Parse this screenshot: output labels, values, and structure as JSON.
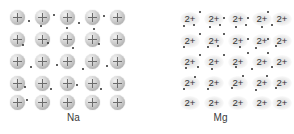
{
  "figure": {
    "background_color": "#ffffff"
  },
  "panels": [
    {
      "id": "na",
      "caption": "Na",
      "element_name": "sodium",
      "ion_symbol": "+",
      "ion_charge": 1,
      "ion_style": "sphere-with-plus",
      "ion_color": "#c9c9c9",
      "electron_color": "#2b2b2b",
      "grid": {
        "rows": 5,
        "cols": 5
      },
      "ion_positions": [
        {
          "x": 10,
          "y": 10
        },
        {
          "x": 35,
          "y": 10
        },
        {
          "x": 60,
          "y": 10
        },
        {
          "x": 85,
          "y": 10
        },
        {
          "x": 110,
          "y": 10
        },
        {
          "x": 10,
          "y": 32
        },
        {
          "x": 35,
          "y": 32
        },
        {
          "x": 60,
          "y": 32
        },
        {
          "x": 85,
          "y": 32
        },
        {
          "x": 110,
          "y": 32
        },
        {
          "x": 10,
          "y": 54
        },
        {
          "x": 35,
          "y": 54
        },
        {
          "x": 60,
          "y": 54
        },
        {
          "x": 85,
          "y": 54
        },
        {
          "x": 110,
          "y": 54
        },
        {
          "x": 10,
          "y": 76
        },
        {
          "x": 35,
          "y": 76
        },
        {
          "x": 60,
          "y": 76
        },
        {
          "x": 85,
          "y": 76
        },
        {
          "x": 110,
          "y": 76
        },
        {
          "x": 10,
          "y": 95
        },
        {
          "x": 35,
          "y": 95
        },
        {
          "x": 60,
          "y": 95
        },
        {
          "x": 85,
          "y": 95
        },
        {
          "x": 110,
          "y": 95
        }
      ],
      "electron_count": 20,
      "electron_positions": [
        {
          "x": 28,
          "y": 20
        },
        {
          "x": 53,
          "y": 14
        },
        {
          "x": 78,
          "y": 22
        },
        {
          "x": 103,
          "y": 15
        },
        {
          "x": 40,
          "y": 25
        },
        {
          "x": 66,
          "y": 27
        },
        {
          "x": 93,
          "y": 28
        },
        {
          "x": 22,
          "y": 44
        },
        {
          "x": 47,
          "y": 42
        },
        {
          "x": 72,
          "y": 47
        },
        {
          "x": 98,
          "y": 43
        },
        {
          "x": 30,
          "y": 66
        },
        {
          "x": 56,
          "y": 64
        },
        {
          "x": 82,
          "y": 68
        },
        {
          "x": 106,
          "y": 65
        },
        {
          "x": 24,
          "y": 86
        },
        {
          "x": 50,
          "y": 88
        },
        {
          "x": 76,
          "y": 84
        },
        {
          "x": 100,
          "y": 88
        },
        {
          "x": 26,
          "y": 99
        }
      ]
    },
    {
      "id": "mg",
      "caption": "Mg",
      "element_name": "magnesium",
      "ion_symbol": "2+",
      "ion_charge": 2,
      "ion_style": "text-label",
      "ion_color": "#cdcdcd",
      "electron_color": "#2b2b2b",
      "grid": {
        "rows": 5,
        "cols": 5
      },
      "ion_positions": [
        {
          "x": 33,
          "y": 12
        },
        {
          "x": 57,
          "y": 12
        },
        {
          "x": 81,
          "y": 12
        },
        {
          "x": 105,
          "y": 12
        },
        {
          "x": 125,
          "y": 12
        },
        {
          "x": 33,
          "y": 34
        },
        {
          "x": 57,
          "y": 34
        },
        {
          "x": 81,
          "y": 34
        },
        {
          "x": 105,
          "y": 34
        },
        {
          "x": 125,
          "y": 34
        },
        {
          "x": 33,
          "y": 55
        },
        {
          "x": 57,
          "y": 55
        },
        {
          "x": 81,
          "y": 55
        },
        {
          "x": 105,
          "y": 55
        },
        {
          "x": 125,
          "y": 55
        },
        {
          "x": 33,
          "y": 76
        },
        {
          "x": 57,
          "y": 76
        },
        {
          "x": 81,
          "y": 76
        },
        {
          "x": 105,
          "y": 76
        },
        {
          "x": 125,
          "y": 76
        },
        {
          "x": 33,
          "y": 96
        },
        {
          "x": 57,
          "y": 96
        },
        {
          "x": 81,
          "y": 96
        },
        {
          "x": 105,
          "y": 96
        },
        {
          "x": 125,
          "y": 96
        }
      ],
      "electron_count": 40,
      "electron_positions": [
        {
          "x": 52,
          "y": 11
        },
        {
          "x": 76,
          "y": 17
        },
        {
          "x": 100,
          "y": 17
        },
        {
          "x": 120,
          "y": 11
        },
        {
          "x": 36,
          "y": 25
        },
        {
          "x": 46,
          "y": 24
        },
        {
          "x": 62,
          "y": 26
        },
        {
          "x": 72,
          "y": 24
        },
        {
          "x": 88,
          "y": 26
        },
        {
          "x": 98,
          "y": 24
        },
        {
          "x": 114,
          "y": 26
        },
        {
          "x": 124,
          "y": 24
        },
        {
          "x": 52,
          "y": 33
        },
        {
          "x": 76,
          "y": 33
        },
        {
          "x": 100,
          "y": 38
        },
        {
          "x": 120,
          "y": 38
        },
        {
          "x": 36,
          "y": 46
        },
        {
          "x": 60,
          "y": 46
        },
        {
          "x": 70,
          "y": 45
        },
        {
          "x": 92,
          "y": 46
        },
        {
          "x": 108,
          "y": 47
        },
        {
          "x": 128,
          "y": 45
        },
        {
          "x": 52,
          "y": 54
        },
        {
          "x": 76,
          "y": 54
        },
        {
          "x": 100,
          "y": 52
        },
        {
          "x": 120,
          "y": 52
        },
        {
          "x": 38,
          "y": 67
        },
        {
          "x": 50,
          "y": 66
        },
        {
          "x": 64,
          "y": 68
        },
        {
          "x": 88,
          "y": 66
        },
        {
          "x": 104,
          "y": 68
        },
        {
          "x": 124,
          "y": 66
        },
        {
          "x": 47,
          "y": 76
        },
        {
          "x": 95,
          "y": 75
        },
        {
          "x": 119,
          "y": 75
        },
        {
          "x": 36,
          "y": 88
        },
        {
          "x": 60,
          "y": 88
        },
        {
          "x": 84,
          "y": 87
        },
        {
          "x": 108,
          "y": 89
        },
        {
          "x": 128,
          "y": 87
        }
      ]
    }
  ]
}
